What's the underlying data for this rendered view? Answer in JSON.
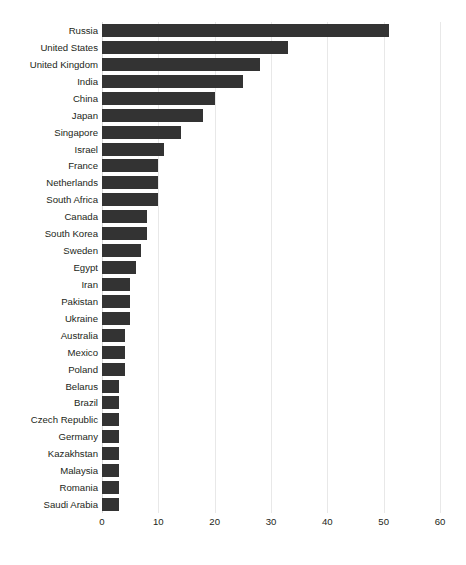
{
  "chart_data": {
    "type": "bar",
    "orientation": "horizontal",
    "title": "",
    "subtitle": "",
    "xlabel": "",
    "ylabel": "",
    "xlim": [
      0,
      60
    ],
    "xticks": [
      0,
      10,
      20,
      30,
      40,
      50,
      60
    ],
    "xtick_labels": [
      "0",
      "10",
      "20",
      "30",
      "40",
      "50",
      "60"
    ],
    "grid": true,
    "grid_axis": "x",
    "legend": false,
    "legend_position": "none",
    "bar_color": "#333333",
    "grid_color": "#e8e8e8",
    "background_color": "#ffffff",
    "text_color": "#231f20",
    "categories": [
      "Russia",
      "United States",
      "United Kingdom",
      "India",
      "China",
      "Japan",
      "Singapore",
      "Israel",
      "France",
      "Netherlands",
      "South Africa",
      "Canada",
      "South Korea",
      "Sweden",
      "Egypt",
      "Iran",
      "Pakistan",
      "Ukraine",
      "Australia",
      "Mexico",
      "Poland",
      "Belarus",
      "Brazil",
      "Czech Republic",
      "Germany",
      "Kazakhstan",
      "Malaysia",
      "Romania",
      "Saudi Arabia"
    ],
    "values": [
      51,
      33,
      28,
      25,
      20,
      18,
      14,
      11,
      10,
      10,
      10,
      8,
      8,
      7,
      6,
      5,
      5,
      5,
      4,
      4,
      4,
      3,
      3,
      3,
      3,
      3,
      3,
      3,
      3
    ]
  }
}
